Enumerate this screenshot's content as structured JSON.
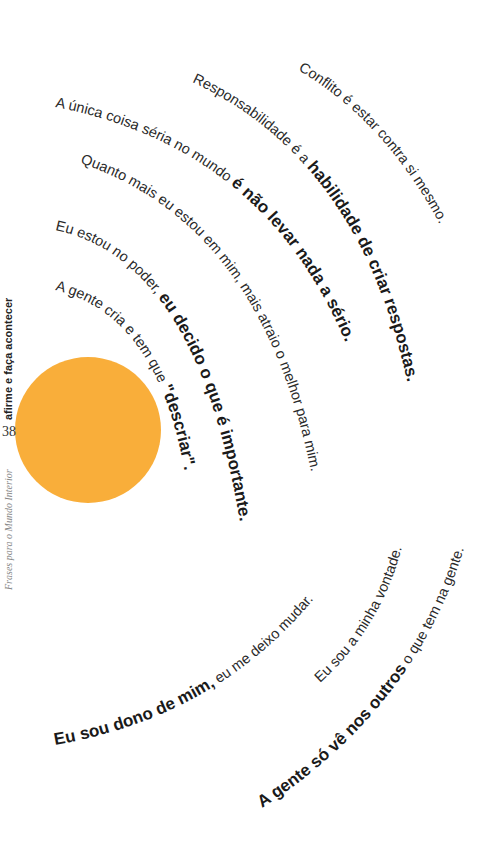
{
  "page": {
    "number": "38",
    "chapter_title": "afirme e faça acontecer",
    "book_title": "Frases para o Mundo Interior",
    "accent_color": "#F9AE3A",
    "text_color": "#222222"
  },
  "quotes_upper": [
    {
      "regular": "Conflito é estar contra si mesmo.",
      "bold": ""
    },
    {
      "regular": "Responsabilidade é a ",
      "bold": "habilidade de criar respostas."
    },
    {
      "regular": "A única coisa séria no mundo ",
      "bold": "é não levar nada a sério."
    },
    {
      "regular": "Quanto mais eu estou em mim, mais atraio o melhor para mim.",
      "bold": ""
    },
    {
      "regular": "Eu estou no poder, ",
      "bold": "eu decido o que é importante."
    },
    {
      "regular": "A gente cria e tem que ",
      "bold": "\"descriar\"."
    }
  ],
  "quotes_lower": [
    {
      "bold": "Eu sou dono de mim,",
      "regular": " eu me deixo mudar."
    },
    {
      "bold": "",
      "regular": "Eu sou a minha vontade."
    },
    {
      "bold": "A gente só vê nos outros",
      "regular": " o que tem na gente."
    }
  ],
  "decoration": {
    "circle_icon": "orange-sun-circle"
  }
}
